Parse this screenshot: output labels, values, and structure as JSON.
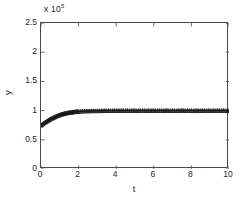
{
  "figure": {
    "background": "#ffffff",
    "axis_color": "#4a4a4a",
    "data_color": "#1a1a1a",
    "exponent_prefix": "x 10",
    "exponent_power": "5"
  },
  "chart_data": {
    "type": "line",
    "title": "",
    "subtitle": "",
    "xlabel": "t",
    "ylabel": "y",
    "y_multiplier": 100000,
    "y_multiplier_text": "x 10^5",
    "xlim": [
      0,
      10
    ],
    "ylim": [
      0,
      2.5
    ],
    "xticks": [
      0,
      2,
      4,
      6,
      8,
      10
    ],
    "xticklabels": [
      "0",
      "2",
      "4",
      "6",
      "8",
      "10"
    ],
    "yticks": [
      0,
      0.5,
      1,
      1.5,
      2,
      2.5
    ],
    "yticklabels": [
      "0",
      "0.5",
      "1",
      "1.5",
      "2",
      "2.5"
    ],
    "grid": false,
    "legend": null,
    "box": true,
    "tick_direction": "in",
    "series": [
      {
        "name": "mean trajectory",
        "style": "line",
        "marker": "none",
        "color": "#1a1a1a",
        "x": [
          0.0,
          0.1,
          0.2,
          0.3,
          0.4,
          0.5,
          0.6,
          0.7,
          0.8,
          0.9,
          1.0,
          1.2,
          1.4,
          1.6,
          1.8,
          2.0,
          2.5,
          3.0,
          3.5,
          4.0,
          4.5,
          5.0,
          5.5,
          6.0,
          6.5,
          7.0,
          7.5,
          8.0,
          8.5,
          9.0,
          9.5,
          10.0
        ],
        "y": [
          0.75,
          0.772,
          0.794,
          0.815,
          0.835,
          0.854,
          0.871,
          0.887,
          0.901,
          0.914,
          0.925,
          0.944,
          0.958,
          0.969,
          0.977,
          0.983,
          0.992,
          0.996,
          0.998,
          0.999,
          1.0,
          1.0,
          1.0,
          1.0,
          1.0,
          1.0,
          1.0,
          1.0,
          1.0,
          1.0,
          1.0,
          1.0
        ]
      },
      {
        "name": "simulation samples",
        "style": "markers",
        "marker": "triangle-plus",
        "color": "#1a1a1a",
        "x": [
          0.0,
          0.05,
          0.1,
          0.15,
          0.2,
          0.25,
          0.3,
          0.35,
          0.4,
          0.45,
          0.5,
          0.55,
          0.6,
          0.65,
          0.7,
          0.75,
          0.8,
          0.85,
          0.9,
          0.95,
          1.0,
          1.05,
          1.1,
          1.15,
          1.2,
          1.25,
          1.3,
          1.35,
          1.4,
          1.45,
          1.5,
          1.55,
          1.6,
          1.65,
          1.7,
          1.75,
          1.8,
          1.85,
          1.9,
          1.95,
          2.0,
          2.1,
          2.2,
          2.3,
          2.4,
          2.5,
          2.6,
          2.7,
          2.8,
          2.9,
          3.0,
          3.1,
          3.2,
          3.3,
          3.4,
          3.5,
          3.6,
          3.7,
          3.8,
          3.9,
          4.0,
          4.1,
          4.2,
          4.3,
          4.4,
          4.5,
          4.6,
          4.7,
          4.8,
          4.9,
          5.0,
          5.1,
          5.2,
          5.3,
          5.4,
          5.5,
          5.6,
          5.7,
          5.8,
          5.9,
          6.0,
          6.1,
          6.2,
          6.3,
          6.4,
          6.5,
          6.6,
          6.7,
          6.8,
          6.9,
          7.0,
          7.1,
          7.2,
          7.3,
          7.4,
          7.5,
          7.6,
          7.7,
          7.8,
          7.9,
          8.0,
          8.1,
          8.2,
          8.3,
          8.4,
          8.5,
          8.6,
          8.7,
          8.8,
          8.9,
          9.0,
          9.1,
          9.2,
          9.3,
          9.4,
          9.5,
          9.6,
          9.7,
          9.8,
          9.9,
          10.0
        ],
        "y": [
          0.748,
          0.758,
          0.772,
          0.787,
          0.796,
          0.802,
          0.818,
          0.826,
          0.833,
          0.849,
          0.855,
          0.862,
          0.874,
          0.879,
          0.888,
          0.893,
          0.903,
          0.909,
          0.915,
          0.922,
          0.927,
          0.934,
          0.938,
          0.943,
          0.947,
          0.951,
          0.955,
          0.958,
          0.961,
          0.966,
          0.968,
          0.971,
          0.972,
          0.975,
          0.977,
          0.979,
          0.981,
          0.982,
          0.984,
          0.985,
          0.986,
          0.989,
          0.991,
          0.992,
          0.993,
          0.994,
          0.995,
          0.996,
          0.997,
          0.996,
          0.998,
          0.997,
          0.999,
          0.998,
          1.0,
          0.999,
          1.001,
          1.0,
          0.999,
          1.002,
          1.0,
          1.001,
          0.999,
          1.002,
          1.0,
          1.001,
          1.003,
          0.999,
          1.0,
          1.002,
          1.001,
          0.998,
          1.002,
          1.0,
          1.003,
          1.001,
          0.999,
          1.002,
          1.0,
          1.001,
          1.003,
          0.999,
          1.001,
          1.0,
          1.002,
          0.998,
          1.001,
          1.003,
          1.0,
          0.999,
          1.002,
          1.001,
          0.998,
          1.003,
          1.0,
          1.005,
          1.001,
          0.999,
          1.004,
          1.0,
          1.002,
          0.998,
          1.001,
          1.003,
          0.999,
          1.0,
          1.002,
          1.001,
          0.998,
          1.003,
          1.001,
          0.999,
          1.002,
          1.0,
          1.004,
          0.999,
          1.001,
          1.003,
          1.0,
          0.998,
          1.001
        ]
      }
    ]
  }
}
